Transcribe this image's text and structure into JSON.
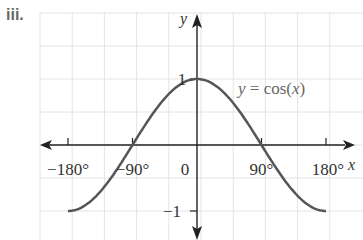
{
  "problem_label": "iii.",
  "chart_data": {
    "type": "line",
    "title": "",
    "function_label_lhs": "y",
    "function_label_eq": " = cos(",
    "function_label_var": "x",
    "function_label_end": ")",
    "xlabel": "x",
    "ylabel": "y",
    "xlim": [
      -180,
      180
    ],
    "ylim": [
      -1,
      1
    ],
    "x_ticks": [
      -180,
      -90,
      0,
      90,
      180
    ],
    "x_tick_labels": [
      "−180°",
      "−90°",
      "0",
      "90°",
      "180°"
    ],
    "y_ticks": [
      1,
      -1
    ],
    "y_tick_labels": [
      "1",
      "−1"
    ],
    "grid": true,
    "series": [
      {
        "name": "y = cos(x)",
        "x": [
          -180,
          -150,
          -120,
          -90,
          -60,
          -30,
          0,
          30,
          60,
          90,
          120,
          150,
          180
        ],
        "values": [
          -1,
          -0.866,
          -0.5,
          0,
          0.5,
          0.866,
          1,
          0.866,
          0.5,
          0,
          -0.5,
          -0.866,
          -1
        ]
      }
    ],
    "colors": {
      "curve": "#555555",
      "axis": "#222222",
      "grid": "#e4e4e4"
    }
  }
}
